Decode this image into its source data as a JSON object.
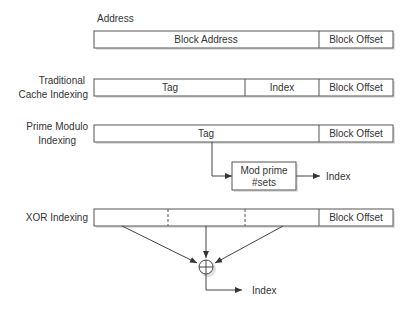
{
  "diagram": {
    "title": "Address",
    "address_row": {
      "fields": [
        "Block Address",
        "Block Offset"
      ]
    },
    "traditional": {
      "label_line1": "Traditional",
      "label_line2": "Cache Indexing",
      "fields": [
        "Tag",
        "Index",
        "Block Offset"
      ]
    },
    "prime_modulo": {
      "label_line1": "Prime Modulo",
      "label_line2": "Indexing",
      "fields": [
        "Tag",
        "Block Offset"
      ],
      "mod_box_line1": "Mod prime",
      "mod_box_line2": "#sets",
      "output": "Index"
    },
    "xor": {
      "label": "XOR Indexing",
      "fields": [
        "",
        "",
        "",
        "Block Offset"
      ],
      "operator": "xor-circle-plus",
      "output": "Index"
    },
    "colors": {
      "stroke": "#555555",
      "text": "#333333",
      "background": "#ffffff"
    }
  }
}
